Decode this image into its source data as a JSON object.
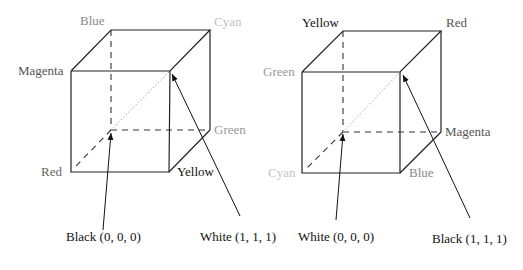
{
  "diagrams": [
    {
      "name": "rgb-cube",
      "vertex_labels": {
        "back_top_left": {
          "text": "Blue",
          "color": "#8a8a8a"
        },
        "back_top_right": {
          "text": "Cyan",
          "color": "#c4c4c4"
        },
        "front_top_left": {
          "text": "Magenta",
          "color": "#555555"
        },
        "back_bottom_right": {
          "text": "Green",
          "color": "#9a9a9a"
        },
        "front_bottom_left": {
          "text": "Red",
          "color": "#666666"
        },
        "front_bottom_right": {
          "text": "Yellow",
          "color": "#111111"
        }
      },
      "callouts": {
        "origin": "Black (0, 0, 0)",
        "far": "White (1, 1, 1)"
      }
    },
    {
      "name": "cmy-cube",
      "vertex_labels": {
        "back_top_left": {
          "text": "Yellow",
          "color": "#111111"
        },
        "back_top_right": {
          "text": "Red",
          "color": "#555555"
        },
        "front_top_left": {
          "text": "Green",
          "color": "#9a9a9a"
        },
        "back_bottom_right": {
          "text": "Magenta",
          "color": "#555555"
        },
        "front_bottom_left": {
          "text": "Cyan",
          "color": "#c4c4c4"
        },
        "front_bottom_right": {
          "text": "Blue",
          "color": "#8a8a8a"
        }
      },
      "callouts": {
        "origin": "White (0, 0, 0)",
        "far": "Black (1, 1, 1)"
      }
    }
  ]
}
